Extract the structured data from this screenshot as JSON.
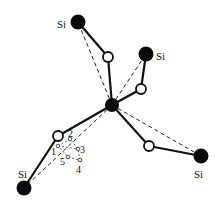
{
  "diagram": {
    "title": "",
    "atoms": {
      "center": {
        "x": 112,
        "y": 105,
        "r": 7
      },
      "si": [
        {
          "id": "si-top-left",
          "label": "Si",
          "x": 78,
          "y": 22,
          "lx": 57,
          "ly": 28
        },
        {
          "id": "si-top-right",
          "label": "Si",
          "x": 146,
          "y": 54,
          "lx": 156,
          "ly": 60
        },
        {
          "id": "si-bottom-left",
          "label": "Si",
          "x": 24,
          "y": 188,
          "lx": 18,
          "ly": 178
        },
        {
          "id": "si-bottom-right",
          "label": "Si",
          "x": 201,
          "y": 156,
          "lx": 194,
          "ly": 178
        }
      ],
      "oxygen": [
        {
          "id": "o-top",
          "x": 108,
          "y": 57
        },
        {
          "id": "o-right",
          "x": 141,
          "y": 89
        },
        {
          "id": "o-left",
          "x": 58,
          "y": 136
        },
        {
          "id": "o-bottom-right",
          "x": 149,
          "y": 146
        }
      ]
    },
    "sites": [
      {
        "label": "1",
        "x": 58,
        "y": 146,
        "lx": 51,
        "ly": 155
      },
      {
        "label": "2",
        "x": 70,
        "y": 139,
        "lx": 68,
        "ly": 137
      },
      {
        "label": "3",
        "x": 78,
        "y": 149,
        "lx": 80,
        "ly": 153
      },
      {
        "label": "4",
        "x": 80,
        "y": 160,
        "lx": 76,
        "ly": 173
      },
      {
        "label": "5",
        "x": 68,
        "y": 157,
        "lx": 60,
        "ly": 165
      }
    ]
  }
}
